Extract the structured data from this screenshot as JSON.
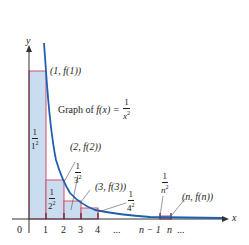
{
  "diagram": {
    "axes": {
      "x_label": "x",
      "y_label": "y",
      "origin_label": "0",
      "x_ticks": [
        "1",
        "2",
        "3",
        "4",
        "...",
        "n − 1",
        "n",
        "..."
      ]
    },
    "graph_label": {
      "prefix": "Graph of ",
      "func": "f(x) = ",
      "num": "1",
      "den": "x",
      "exp": "2"
    },
    "points": [
      {
        "label": "(1, f(1))"
      },
      {
        "label": "(2, f(2))"
      },
      {
        "label": "(3, f(3))"
      },
      {
        "label": "(n, f(n))"
      }
    ],
    "rect_labels": [
      {
        "num": "1",
        "den": "1",
        "exp": "2"
      },
      {
        "num": "1",
        "den": "2",
        "exp": "2"
      },
      {
        "num": "1",
        "den": "3",
        "exp": "2"
      },
      {
        "num": "1",
        "den": "4",
        "exp": "2"
      },
      {
        "num": "1",
        "den": "n",
        "exp": "2"
      }
    ],
    "colors": {
      "curve": "#1f5fae",
      "rect_fill": "#c9dcf0",
      "rect_edge": "#d0506a",
      "axis": "#333333",
      "tick": "#5a1e2e"
    }
  }
}
